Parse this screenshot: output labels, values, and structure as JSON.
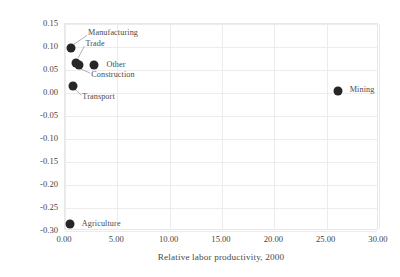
{
  "chart_data": {
    "type": "scatter",
    "title": "",
    "xlabel": "Relative labor productivity, 2000",
    "ylabel": "Change in employment shares, 2000–2019",
    "xlim": [
      0,
      30
    ],
    "ylim": [
      -0.3,
      0.15
    ],
    "xticks": [
      "0.00",
      "5.00",
      "10.00",
      "15.00",
      "20.00",
      "25.00",
      "30.00"
    ],
    "xtick_values": [
      0,
      5,
      10,
      15,
      20,
      25,
      30
    ],
    "yticks": [
      "0.15",
      "0.10",
      "0.05",
      "0.00",
      "-0.05",
      "-0.10",
      "-0.15",
      "-0.20",
      "-0.25",
      "-0.30"
    ],
    "ytick_values": [
      0.15,
      0.1,
      0.05,
      0.0,
      -0.05,
      -0.1,
      -0.15,
      -0.2,
      -0.25,
      -0.3
    ],
    "grid": true,
    "legend": "none",
    "marker_color": "#262626",
    "points": [
      {
        "label": "Manufacturing",
        "x": 0.7,
        "y": 0.095,
        "label_x": 2.3,
        "label_y": 0.128
      },
      {
        "label": "Trade",
        "x": 1.1,
        "y": 0.062,
        "label_x": 2.05,
        "label_y": 0.104
      },
      {
        "label": "Construction",
        "x": 1.45,
        "y": 0.058,
        "label_x": 2.6,
        "label_y": 0.036
      },
      {
        "label": "Other",
        "x": 2.85,
        "y": 0.058,
        "label_x": 4.05,
        "label_y": 0.058
      },
      {
        "label": "Transport",
        "x": 0.9,
        "y": 0.012,
        "label_x": 1.75,
        "label_y": -0.012
      },
      {
        "label": "Mining",
        "x": 26.2,
        "y": 0.002,
        "label_x": 27.3,
        "label_y": 0.004
      },
      {
        "label": "Agriculture",
        "x": 0.6,
        "y": -0.288,
        "label_x": 1.7,
        "label_y": -0.288
      }
    ],
    "leaders": [
      {
        "from_x": 2.2,
        "from_y": 0.123,
        "to_x": 0.95,
        "to_y": 0.104
      },
      {
        "from_x": 1.95,
        "from_y": 0.1,
        "to_x": 1.35,
        "to_y": 0.074
      },
      {
        "from_x": 2.5,
        "from_y": 0.041,
        "to_x": 1.6,
        "to_y": 0.05
      },
      {
        "from_x": 1.65,
        "from_y": -0.007,
        "to_x": 1.05,
        "to_y": 0.006
      }
    ]
  }
}
